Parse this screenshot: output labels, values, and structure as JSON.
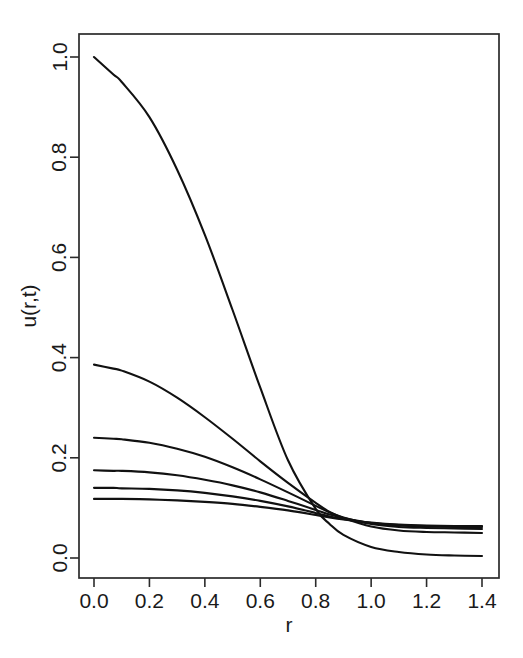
{
  "figure": {
    "background_color": "#ffffff",
    "line_color": "#111111",
    "axis_color": "#2b2b2b"
  },
  "chart_data": {
    "type": "line",
    "title": "",
    "subtitle": "",
    "xlabel": "r",
    "ylabel": "u(r,t)",
    "xlim": [
      0.0,
      1.4
    ],
    "ylim": [
      0.0,
      1.0
    ],
    "xticks": [
      0.0,
      0.2,
      0.4,
      0.6,
      0.8,
      1.0,
      1.2,
      1.4
    ],
    "xtick_labels": [
      "0.0",
      "0.2",
      "0.4",
      "0.6",
      "0.8",
      "1.0",
      "1.2",
      "1.4"
    ],
    "yticks": [
      0.0,
      0.2,
      0.4,
      0.6,
      0.8,
      1.0
    ],
    "ytick_labels": [
      "0.0",
      "0.2",
      "0.4",
      "0.6",
      "0.8",
      "1.0"
    ],
    "grid": false,
    "legend": false,
    "legend_position": "none",
    "annotations": [],
    "x": [
      0.0,
      0.07,
      0.1,
      0.2,
      0.3,
      0.4,
      0.5,
      0.6,
      0.7,
      0.8,
      0.85,
      0.9,
      1.0,
      1.1,
      1.2,
      1.3,
      1.4
    ],
    "series": [
      {
        "name": "t1",
        "values": [
          1.0,
          0.965,
          0.95,
          0.88,
          0.775,
          0.645,
          0.495,
          0.34,
          0.195,
          0.098,
          0.068,
          0.046,
          0.022,
          0.012,
          0.007,
          0.005,
          0.004
        ]
      },
      {
        "name": "t2",
        "values": [
          0.386,
          0.378,
          0.374,
          0.352,
          0.32,
          0.281,
          0.238,
          0.193,
          0.15,
          0.11,
          0.092,
          0.08,
          0.063,
          0.055,
          0.052,
          0.051,
          0.05
        ]
      },
      {
        "name": "t3",
        "values": [
          0.24,
          0.238,
          0.237,
          0.23,
          0.218,
          0.202,
          0.181,
          0.157,
          0.131,
          0.104,
          0.091,
          0.081,
          0.068,
          0.062,
          0.06,
          0.059,
          0.058
        ]
      },
      {
        "name": "t4",
        "values": [
          0.175,
          0.174,
          0.174,
          0.171,
          0.165,
          0.156,
          0.145,
          0.131,
          0.114,
          0.096,
          0.087,
          0.08,
          0.07,
          0.065,
          0.063,
          0.062,
          0.062
        ]
      },
      {
        "name": "t5",
        "values": [
          0.14,
          0.14,
          0.139,
          0.138,
          0.135,
          0.13,
          0.123,
          0.114,
          0.103,
          0.09,
          0.083,
          0.078,
          0.07,
          0.066,
          0.064,
          0.063,
          0.063
        ]
      },
      {
        "name": "t6",
        "values": [
          0.118,
          0.118,
          0.118,
          0.117,
          0.115,
          0.112,
          0.108,
          0.102,
          0.095,
          0.086,
          0.081,
          0.077,
          0.071,
          0.067,
          0.065,
          0.064,
          0.064
        ]
      }
    ]
  }
}
